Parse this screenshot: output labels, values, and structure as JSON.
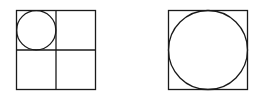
{
  "diagram": {
    "stroke_color": "#1a1a1a",
    "background": "#ffffff",
    "figures": [
      {
        "id": "left-figure",
        "square": {
          "x": 16.5,
          "y": 10.5,
          "size": 79
        },
        "grid": "2x2",
        "circle": {
          "cx": 36,
          "cy": 30,
          "r": 19.5
        }
      },
      {
        "id": "right-figure",
        "square": {
          "x": 168.5,
          "y": 10.5,
          "size": 79
        },
        "circle": {
          "cx": 208,
          "cy": 50,
          "r": 39.5
        }
      }
    ]
  }
}
